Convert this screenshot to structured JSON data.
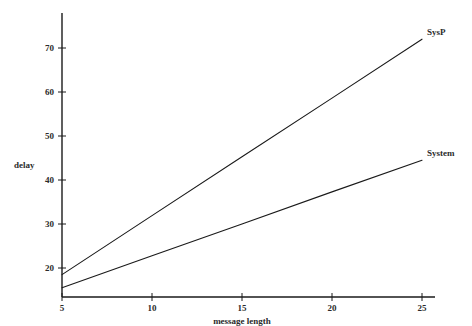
{
  "chart_data": {
    "type": "line",
    "title": "",
    "subtitle": "",
    "xlabel": "message length",
    "ylabel": "delay",
    "xlim": [
      5,
      25
    ],
    "ylim": [
      14,
      77
    ],
    "xticks": [
      5,
      10,
      15,
      20,
      25
    ],
    "xtick_labels": [
      "5",
      "10",
      "15",
      "20",
      "25"
    ],
    "yticks": [
      20,
      30,
      40,
      50,
      60,
      70
    ],
    "ytick_labels": [
      "20",
      "30",
      "40",
      "50",
      "60",
      "70"
    ],
    "grid": false,
    "legend_position": "line-end-right",
    "series": [
      {
        "name": "SysP",
        "label": "SysP",
        "color": "#1a1a1a",
        "x": [
          5,
          10,
          15,
          20,
          25
        ],
        "values": [
          18.5,
          31.9,
          45.3,
          58.6,
          72.0
        ]
      },
      {
        "name": "System",
        "label": "System",
        "color": "#1a1a1a",
        "x": [
          5,
          10,
          15,
          20,
          25
        ],
        "values": [
          15.5,
          22.8,
          30.0,
          37.3,
          44.5
        ]
      }
    ]
  },
  "axes": {
    "x_axis_name": "message-length-axis",
    "y_axis_name": "delay-axis"
  }
}
